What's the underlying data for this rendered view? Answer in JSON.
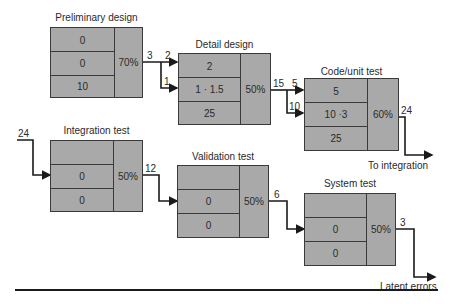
{
  "figure": {
    "stages": [
      {
        "id": "preliminary-design",
        "title": "Preliminary design",
        "rows": [
          "0",
          "0",
          "10"
        ],
        "efficiency": "70%"
      },
      {
        "id": "detail-design",
        "title": "Detail design",
        "rows": [
          "2",
          "1 · 1.5",
          "25"
        ],
        "efficiency": "50%"
      },
      {
        "id": "code-unit-test",
        "title": "Code/unit test",
        "rows": [
          "5",
          "10 ·3",
          "25"
        ],
        "efficiency": "60%"
      },
      {
        "id": "integration-test",
        "title": "Integration test",
        "rows": [
          "",
          "0",
          "0"
        ],
        "efficiency": "50%"
      },
      {
        "id": "validation-test",
        "title": "Validation test",
        "rows": [
          "",
          "0",
          "0"
        ],
        "efficiency": "50%"
      },
      {
        "id": "system-test",
        "title": "System test",
        "rows": [
          "",
          "0",
          "0"
        ],
        "efficiency": "50%"
      }
    ],
    "flows": {
      "prelim_out": "3",
      "prelim_to_detail_top": "2",
      "prelim_to_detail_mid": "1",
      "detail_out": "15",
      "detail_to_code_top": "5",
      "detail_to_code_mid": "10",
      "code_out": "24",
      "integration_in": "24",
      "integration_out": "12",
      "validation_out": "6",
      "system_out": "3"
    },
    "outputs": {
      "to_integration": "To integration",
      "latent_errors": "Latent errors"
    }
  }
}
